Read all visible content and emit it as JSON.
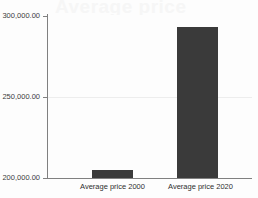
{
  "chart_data": {
    "type": "bar",
    "title": "",
    "subtitle": "",
    "xlabel": "",
    "ylabel": "",
    "categories": [
      "Average price 2000",
      "Average price 2020"
    ],
    "values": [
      205000.0,
      293200.0
    ],
    "series": [
      {
        "name": "Average price",
        "values": [
          205000.0,
          293200.0
        ]
      }
    ],
    "ylim": [
      200000.0,
      300000.0
    ],
    "ytick_labels": [
      "300,000.00",
      "250,000.00",
      "200,000.00"
    ],
    "ytick_values": [
      300000.0,
      250000.0,
      200000.0
    ],
    "grid": true,
    "gridline_values": [
      250000.0
    ],
    "legend": false,
    "legend_position": "none",
    "bar_color": "#3a3a3a",
    "axis_color": "#808080",
    "gridline_color": "#ededed",
    "background_color": "#fdfdfd"
  },
  "watermark": {
    "text": "Average price"
  }
}
